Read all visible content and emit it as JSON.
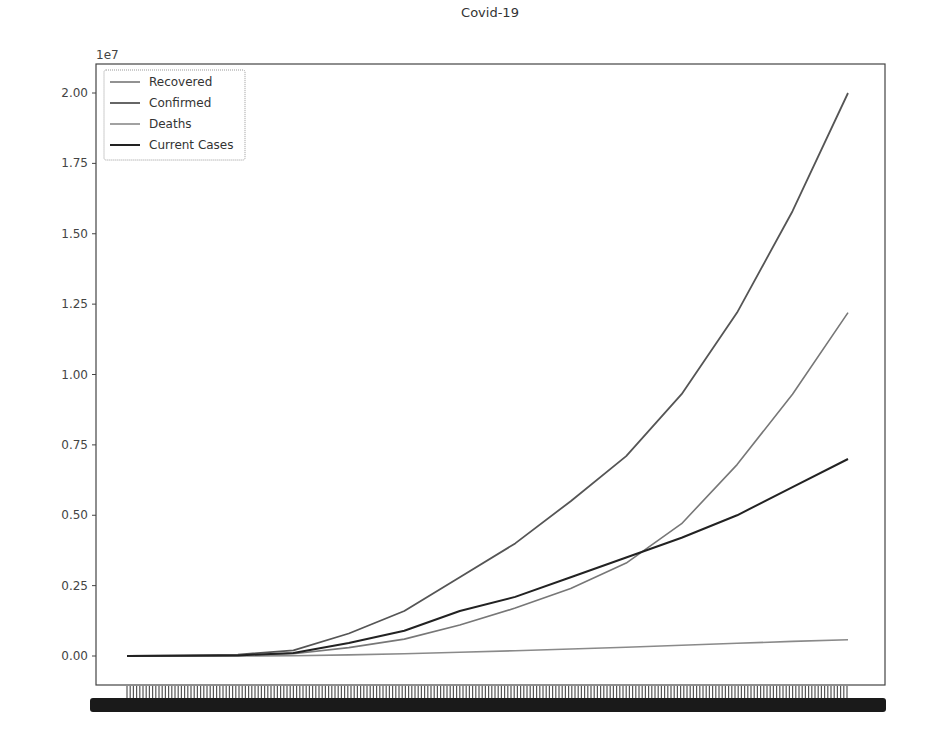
{
  "chart_data": {
    "type": "line",
    "title": "Covid-19",
    "xlabel": "",
    "ylabel": "",
    "y_offset_label": "1e7",
    "ylim": [
      -0.1,
      2.1
    ],
    "yticks": [
      0.0,
      0.25,
      0.5,
      0.75,
      1.0,
      1.25,
      1.5,
      1.75,
      2.0
    ],
    "ytick_labels": [
      "0.00",
      "0.25",
      "0.50",
      "0.75",
      "1.00",
      "1.25",
      "1.50",
      "1.75",
      "2.00"
    ],
    "x_tick_labels_note": "dense overlapping date labels (illegible)",
    "grid": false,
    "legend_position": "upper left",
    "x": [
      0,
      1,
      2,
      3,
      4,
      5,
      6,
      7,
      8,
      9,
      10,
      11,
      12,
      13
    ],
    "series": [
      {
        "name": "Recovered",
        "color": "#777777",
        "width": 1.6,
        "values": [
          0,
          0.001,
          0.003,
          0.008,
          0.03,
          0.06,
          0.11,
          0.17,
          0.24,
          0.33,
          0.47,
          0.68,
          0.93,
          1.22
        ]
      },
      {
        "name": "Confirmed",
        "color": "#555555",
        "width": 1.8,
        "values": [
          0,
          0.002,
          0.005,
          0.02,
          0.08,
          0.16,
          0.28,
          0.4,
          0.55,
          0.71,
          0.93,
          1.22,
          1.58,
          2.0
        ]
      },
      {
        "name": "Deaths",
        "color": "#8a8a8a",
        "width": 1.6,
        "values": [
          0,
          0,
          0,
          0.001,
          0.004,
          0.008,
          0.013,
          0.019,
          0.025,
          0.031,
          0.038,
          0.045,
          0.052,
          0.058
        ]
      },
      {
        "name": "Current Cases",
        "color": "#222222",
        "width": 2.0,
        "values": [
          0,
          0.001,
          0.002,
          0.011,
          0.046,
          0.09,
          0.16,
          0.21,
          0.28,
          0.35,
          0.42,
          0.5,
          0.6,
          0.7
        ]
      }
    ]
  }
}
